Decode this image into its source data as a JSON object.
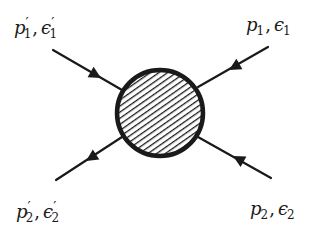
{
  "diagram": {
    "type": "scattering-blob",
    "ink_color": "#1a1a1a",
    "background_color": "#ffffff",
    "blob": {
      "cx": 160,
      "cy": 113,
      "r": 44,
      "fill": "hatched",
      "hatch_direction": "diagonal-up-right",
      "stroke_width": 4
    },
    "legs": [
      {
        "id": "top-left",
        "from": [
          53,
          50
        ],
        "to": [
          120,
          89
        ],
        "arrow_at": [
          96,
          75
        ],
        "arrow_direction": "toward-blob",
        "label": {
          "momentum": "p",
          "polarization": "ϵ",
          "index": "1",
          "primed": true,
          "x": 16,
          "y": 14
        }
      },
      {
        "id": "top-right",
        "from": [
          268,
          47
        ],
        "to": [
          200,
          86
        ],
        "arrow_at": [
          234,
          67
        ],
        "arrow_direction": "toward-blob",
        "label": {
          "momentum": "p",
          "polarization": "ϵ",
          "index": "1",
          "primed": false,
          "x": 244,
          "y": 14
        }
      },
      {
        "id": "bottom-left",
        "from": [
          120,
          139
        ],
        "to": [
          56,
          180
        ],
        "arrow_at": [
          92,
          157
        ],
        "arrow_direction": "away-from-blob",
        "label": {
          "momentum": "p",
          "polarization": "ϵ",
          "index": "2",
          "primed": true,
          "x": 18,
          "y": 198
        }
      },
      {
        "id": "bottom-right",
        "from": [
          271,
          178
        ],
        "to": [
          200,
          138
        ],
        "arrow_at": [
          238,
          159
        ],
        "arrow_direction": "toward-blob",
        "label": {
          "momentum": "p",
          "polarization": "ϵ",
          "index": "2",
          "primed": false,
          "x": 250,
          "y": 198
        }
      }
    ],
    "labels": {
      "top_left": {
        "p": "p",
        "p_sub": "1",
        "e": "ϵ",
        "e_sub": "1",
        "prime": "′",
        "comma": ","
      },
      "top_right": {
        "p": "p",
        "p_sub": "1",
        "e": "ϵ",
        "e_sub": "1",
        "comma": ","
      },
      "bottom_left": {
        "p": "p",
        "p_sub": "2",
        "e": "ϵ",
        "e_sub": "2",
        "prime": "′",
        "comma": ","
      },
      "bottom_right": {
        "p": "p",
        "p_sub": "2",
        "e": "ϵ",
        "e_sub": "2",
        "comma": ","
      }
    }
  }
}
